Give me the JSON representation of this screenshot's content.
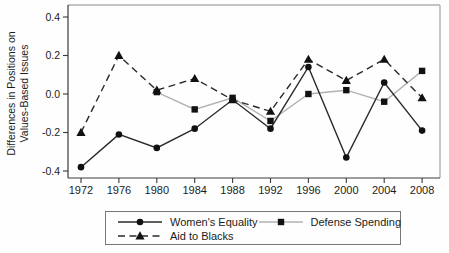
{
  "figure": {
    "background": "#fefefe",
    "axis_color": "#3a3a3a",
    "frame_color": "#b0b0b0",
    "text_color": "#1c1c1c",
    "legend_border_color": "#777777"
  },
  "chart_data": {
    "type": "line",
    "title": "",
    "xlabel": "",
    "ylabel": "Differences in Positions on Values-Based Issues",
    "ylabel_line1": "Differences in Positions on",
    "ylabel_line2": "Values-Based Issues",
    "x": [
      1972,
      1976,
      1980,
      1984,
      1988,
      1992,
      1996,
      2000,
      2004,
      2008
    ],
    "yticks": [
      0.4,
      0.2,
      0.0,
      -0.2,
      -0.4
    ],
    "ylim": [
      -0.44,
      0.46
    ],
    "grid": false,
    "legend_position": "bottom",
    "series": [
      {
        "name": "Women's Equality",
        "marker": "circle",
        "line_style": "solid",
        "line_color": "#2a2a2a",
        "marker_color": "#111111",
        "values": [
          -0.38,
          -0.21,
          -0.28,
          -0.18,
          -0.03,
          -0.18,
          0.14,
          -0.33,
          0.06,
          -0.19
        ]
      },
      {
        "name": "Defense Spending",
        "marker": "square",
        "line_style": "solid",
        "line_color": "#b2b2b2",
        "marker_color": "#111111",
        "values": [
          null,
          null,
          0.01,
          -0.08,
          -0.02,
          -0.14,
          0.0,
          0.02,
          -0.04,
          0.12
        ]
      },
      {
        "name": "Aid to Blacks",
        "marker": "triangle",
        "line_style": "dashed",
        "line_color": "#2a2a2a",
        "marker_color": "#111111",
        "values": [
          -0.2,
          0.2,
          0.02,
          0.08,
          -0.03,
          -0.09,
          0.18,
          0.07,
          0.18,
          -0.02
        ]
      }
    ]
  }
}
